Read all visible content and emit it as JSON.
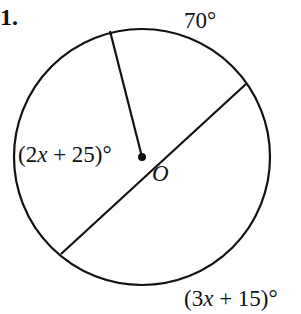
{
  "problem": {
    "number_label": "1."
  },
  "diagram": {
    "circle": {
      "cx": 142,
      "cy": 157,
      "r": 128,
      "stroke": "#111111"
    },
    "center": {
      "name": "O",
      "x": 142,
      "y": 157
    },
    "segments": [
      {
        "name": "radius-top",
        "x1": 142,
        "y1": 157,
        "x2": 110,
        "y2": 31
      },
      {
        "name": "diameter",
        "x1": 61,
        "y1": 254,
        "x2": 246,
        "y2": 84
      }
    ],
    "labels": {
      "arc_top": "70°",
      "angle_left": "(2x + 25)°",
      "arc_bottom": "(3x + 15)°",
      "center": "O"
    }
  }
}
